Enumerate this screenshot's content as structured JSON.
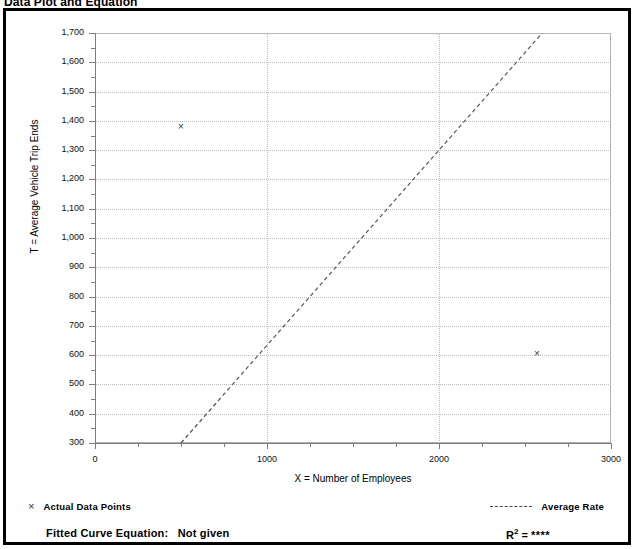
{
  "header": {
    "title": "Data Plot and Equation",
    "right_note": ""
  },
  "legend": {
    "data_points_marker": "×",
    "data_points_label": "Actual Data Points",
    "average_rate_label": "Average Rate"
  },
  "equation": {
    "fitted_label": "Fitted Curve Equation:",
    "fitted_value": "Not given",
    "r_label": "R",
    "r_exponent": "2",
    "r_equals": " = ",
    "r_value": "****"
  },
  "chart_data": {
    "type": "scatter",
    "title": "Data Plot and Equation",
    "xlabel": "X = Number of Employees",
    "ylabel": "T = Average Vehicle Trip Ends",
    "xlim": [
      0,
      3000
    ],
    "ylim": [
      300,
      1700
    ],
    "grid": true,
    "legend_position": "below-plot",
    "x_ticks": [
      0,
      1000,
      2000,
      3000
    ],
    "x_tick_labels": [
      "0",
      "1000",
      "2000",
      "3000"
    ],
    "x_minor_ticks": [
      250,
      500,
      750,
      1250,
      1500,
      1750,
      2250,
      2500,
      2750
    ],
    "y_ticks": [
      300,
      400,
      500,
      600,
      700,
      800,
      900,
      1000,
      1100,
      1200,
      1300,
      1400,
      1500,
      1600,
      1700
    ],
    "y_tick_labels": [
      "300",
      "400",
      "500",
      "600",
      "700",
      "800",
      "900",
      "1,000",
      "1,100",
      "1,200",
      "1,300",
      "1,400",
      "1,500",
      "1,600",
      "1,700"
    ],
    "series": [
      {
        "name": "Actual Data Points",
        "type": "scatter",
        "marker": "x",
        "points": [
          {
            "x": 500,
            "y": 1380
          },
          {
            "x": 2570,
            "y": 605
          }
        ]
      },
      {
        "name": "Average Rate",
        "type": "line",
        "style": "dashed",
        "points": [
          {
            "x": 500,
            "y": 300
          },
          {
            "x": 2600,
            "y": 1700
          }
        ]
      }
    ]
  }
}
